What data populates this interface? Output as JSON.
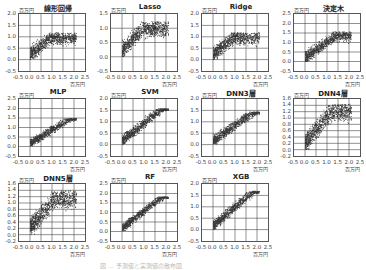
{
  "chart_data": [
    {
      "type": "scatter",
      "title": "線形回帰",
      "xlabel": "百万円",
      "ylabel": "百万円",
      "xlim": [
        -0.5,
        2.5
      ],
      "ylim": [
        -0.5,
        2.0
      ],
      "xticks": [
        "-0.5",
        "0.0",
        "0.5",
        "1.0",
        "1.5",
        "2.0",
        "2.5"
      ],
      "yticks": [
        "2.0",
        "1.5",
        "1.0",
        "0.5",
        "0.0",
        "-0.5"
      ],
      "grid": true,
      "description": "dense point cloud rising from (0,0.3) to (1.0,1.1), flattening around 1.0 toward x=2.0"
    },
    {
      "type": "scatter",
      "title": "Lasso",
      "xlabel": "百万円",
      "ylabel": "百万円",
      "xlim": [
        -0.5,
        2.5
      ],
      "ylim": [
        -0.5,
        1.5
      ],
      "xticks": [
        "-0.5",
        "0.0",
        "0.5",
        "1.0",
        "1.5",
        "2.0",
        "2.5"
      ],
      "yticks": [
        "1.5",
        "1.0",
        "0.5",
        "0.0",
        "-0.5"
      ],
      "grid": true,
      "description": "dense cloud from (0,0.3) to (1.0,1.2), plateau near 1.0"
    },
    {
      "type": "scatter",
      "title": "Ridge",
      "xlabel": "百万円",
      "ylabel": "百万円",
      "xlim": [
        -0.5,
        2.5
      ],
      "ylim": [
        -0.5,
        2.0
      ],
      "xticks": [
        "-0.5",
        "0.0",
        "0.5",
        "1.0",
        "1.5",
        "2.0",
        "2.5"
      ],
      "yticks": [
        "2.0",
        "1.5",
        "1.0",
        "0.5",
        "0.0",
        "-0.5"
      ],
      "grid": true,
      "description": "similar to linear regression"
    },
    {
      "type": "scatter",
      "title": "決定木",
      "xlabel": "百万円",
      "ylabel": "百万円",
      "xlim": [
        -0.5,
        2.5
      ],
      "ylim": [
        -0.5,
        2.5
      ],
      "xticks": [
        "-0.5",
        "0.0",
        "0.5",
        "1.0",
        "1.5",
        "2.0",
        "2.5"
      ],
      "yticks": [
        "2.5",
        "2.0",
        "1.5",
        "1.0",
        "0.5",
        "0.0",
        "-0.5"
      ],
      "grid": true,
      "description": "cloud rising to about 1.5 at x=1.5–2.0"
    },
    {
      "type": "scatter",
      "title": "MLP",
      "xlabel": "百万円",
      "ylabel": "百万円",
      "xlim": [
        -0.5,
        2.5
      ],
      "ylim": [
        -0.5,
        2.5
      ],
      "xticks": [
        "-0.5",
        "0.0",
        "0.5",
        "1.0",
        "1.5",
        "2.0",
        "2.5"
      ],
      "yticks": [
        "2.5",
        "2.0",
        "1.5",
        "1.0",
        "0.5",
        "0.0",
        "-0.5"
      ],
      "grid": true,
      "description": "linear trend up to about 1.4 at x=1.5"
    },
    {
      "type": "scatter",
      "title": "SVM",
      "xlabel": "百万円",
      "ylabel": "百万円",
      "xlim": [
        -0.5,
        2.5
      ],
      "ylim": [
        -0.5,
        2.0
      ],
      "xticks": [
        "-0.5",
        "0.0",
        "0.5",
        "1.0",
        "1.5",
        "2.0",
        "2.5"
      ],
      "yticks": [
        "2.0",
        "1.5",
        "1.0",
        "0.5",
        "0.0",
        "-0.5"
      ],
      "grid": true,
      "description": "linear trend up to about 1.5 at x=1.5"
    },
    {
      "type": "scatter",
      "title": "DNN3層",
      "xlabel": "百万円",
      "ylabel": "百万円",
      "xlim": [
        -0.5,
        2.5
      ],
      "ylim": [
        -0.5,
        2.0
      ],
      "xticks": [
        "-0.5",
        "0.0",
        "0.5",
        "1.0",
        "1.5",
        "2.0",
        "2.5"
      ],
      "yticks": [
        "2.0",
        "1.5",
        "1.0",
        "0.5",
        "0.0",
        "-0.5"
      ],
      "grid": true,
      "description": "linear trend up to about 1.3 at x=1.5"
    },
    {
      "type": "scatter",
      "title": "DNN4層",
      "xlabel": "百万円",
      "ylabel": "百万円",
      "xlim": [
        -0.5,
        2.5
      ],
      "ylim": [
        -0.2,
        1.6
      ],
      "xticks": [
        "-0.5",
        "0.0",
        "0.5",
        "1.0",
        "1.5",
        "2.0",
        "2.5"
      ],
      "yticks": [
        "1.6",
        "1.4",
        "1.2",
        "1.0",
        "0.8",
        "0.6",
        "0.4",
        "0.2",
        "0.0",
        "-0.2"
      ],
      "grid": true,
      "description": "cloud rising to ~1.4, capped near 1.3"
    },
    {
      "type": "scatter",
      "title": "DNN5層",
      "xlabel": "百万円",
      "ylabel": "百万円",
      "xlim": [
        -0.5,
        2.5
      ],
      "ylim": [
        -0.2,
        1.6
      ],
      "xticks": [
        "-0.5",
        "0.0",
        "0.5",
        "1.0",
        "1.5",
        "2.0",
        "2.5"
      ],
      "yticks": [
        "1.6",
        "1.4",
        "1.2",
        "1.0",
        "0.8",
        "0.6",
        "0.4",
        "0.2",
        "0.0",
        "-0.2"
      ],
      "grid": true,
      "description": "cloud rising to ~1.3"
    },
    {
      "type": "scatter",
      "title": "RF",
      "xlabel": "百万円",
      "ylabel": "百万円",
      "xlim": [
        -0.5,
        2.5
      ],
      "ylim": [
        -0.5,
        2.5
      ],
      "xticks": [
        "-0.5",
        "0.0",
        "0.5",
        "1.0",
        "1.5",
        "2.0",
        "2.5"
      ],
      "yticks": [
        "2.5",
        "2.0",
        "1.5",
        "1.0",
        "0.5",
        "0.0",
        "-0.5"
      ],
      "grid": true,
      "description": "tight linear trend up to ~1.7 at x=2.0"
    },
    {
      "type": "scatter",
      "title": "XGB",
      "xlabel": "百万円",
      "ylabel": "百万円",
      "xlim": [
        -0.5,
        2.5
      ],
      "ylim": [
        -0.5,
        2.0
      ],
      "xticks": [
        "-0.5",
        "0.0",
        "0.5",
        "1.0",
        "1.5",
        "2.0",
        "2.5"
      ],
      "yticks": [
        "2.0",
        "1.5",
        "1.0",
        "0.5",
        "0.0",
        "-0.5"
      ],
      "grid": true,
      "description": "tight linear trend up to ~1.6 at x=1.8"
    }
  ],
  "panels": [
    {
      "title": "線形回帰",
      "unit": "百万円",
      "yticks": [
        "2.0",
        "1.5",
        "1.0",
        "0.5",
        "0.0",
        "-0.5"
      ],
      "ymin": -0.5,
      "ymax": 2.0,
      "shape": "plateau",
      "cap": 1.1
    },
    {
      "title": "Lasso",
      "unit": "百万円",
      "yticks": [
        "1.5",
        "1.0",
        "0.5",
        "0.0",
        "-0.5"
      ],
      "ymin": -0.5,
      "ymax": 1.5,
      "shape": "plateau",
      "cap": 1.15
    },
    {
      "title": "Ridge",
      "unit": "百万円",
      "yticks": [
        "2.0",
        "1.5",
        "1.0",
        "0.5",
        "0.0",
        "-0.5"
      ],
      "ymin": -0.5,
      "ymax": 2.0,
      "shape": "plateau",
      "cap": 1.1
    },
    {
      "title": "決定木",
      "unit": "百万円",
      "yticks": [
        "2.5",
        "2.0",
        "1.5",
        "1.0",
        "0.5",
        "0.0",
        "-0.5"
      ],
      "ymin": -0.5,
      "ymax": 2.5,
      "shape": "plateau",
      "cap": 1.5
    },
    {
      "title": "MLP",
      "unit": "百万円",
      "yticks": [
        "2.5",
        "2.0",
        "1.5",
        "1.0",
        "0.5",
        "0.0",
        "-0.5"
      ],
      "ymin": -0.5,
      "ymax": 2.5,
      "shape": "linear",
      "cap": 1.4
    },
    {
      "title": "SVM",
      "unit": "百万円",
      "yticks": [
        "2.0",
        "1.5",
        "1.0",
        "0.5",
        "0.0",
        "-0.5"
      ],
      "ymin": -0.5,
      "ymax": 2.0,
      "shape": "linear",
      "cap": 1.5
    },
    {
      "title": "DNN3層",
      "unit": "百万円",
      "yticks": [
        "2.0",
        "1.5",
        "1.0",
        "0.5",
        "0.0",
        "-0.5"
      ],
      "ymin": -0.5,
      "ymax": 2.0,
      "shape": "linear",
      "cap": 1.35
    },
    {
      "title": "DNN4層",
      "unit": "百万円",
      "yticks": [
        "1.6",
        "1.4",
        "1.2",
        "1.0",
        "0.8",
        "0.6",
        "0.4",
        "0.2",
        "0.0",
        "-0.2"
      ],
      "ymin": -0.2,
      "ymax": 1.6,
      "shape": "plateau",
      "cap": 1.35
    },
    {
      "title": "DNN5層",
      "unit": "百万円",
      "yticks": [
        "1.6",
        "1.4",
        "1.2",
        "1.0",
        "0.8",
        "0.6",
        "0.4",
        "0.2",
        "0.0",
        "-0.2"
      ],
      "ymin": -0.2,
      "ymax": 1.6,
      "shape": "plateau",
      "cap": 1.3
    },
    {
      "title": "RF",
      "unit": "百万円",
      "yticks": [
        "2.5",
        "2.0",
        "1.5",
        "1.0",
        "0.5",
        "0.0",
        "-0.5"
      ],
      "ymin": -0.5,
      "ymax": 2.5,
      "shape": "linear",
      "cap": 1.75
    },
    {
      "title": "XGB",
      "unit": "百万円",
      "yticks": [
        "2.0",
        "1.5",
        "1.0",
        "0.5",
        "0.0",
        "-0.5"
      ],
      "ymin": -0.5,
      "ymax": 2.0,
      "shape": "linear",
      "cap": 1.6
    }
  ],
  "xticks": [
    "-0.5",
    "0.0",
    "0.5",
    "1.0",
    "1.5",
    "2.0",
    "2.5"
  ],
  "caption": "図 … 予測値と実測値の散布図"
}
